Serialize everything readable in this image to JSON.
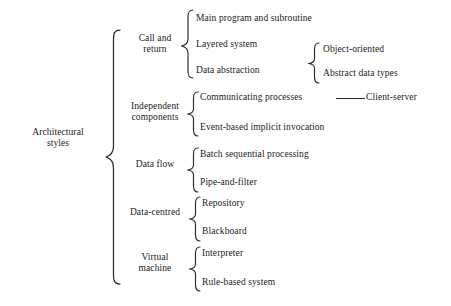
{
  "diagram": {
    "type": "tree",
    "root": {
      "label": "Architectural\nstyles"
    },
    "categories": [
      {
        "label": "Call and\nreturn",
        "children": [
          {
            "label": "Main program and subroutine"
          },
          {
            "label": "Layered system"
          },
          {
            "label": "Data abstraction",
            "children": [
              {
                "label": "Object-oriented"
              },
              {
                "label": "Abstract data types"
              }
            ]
          }
        ]
      },
      {
        "label": "Independent\ncomponents",
        "children": [
          {
            "label": "Communicating processes",
            "linked_to": "Client-server"
          },
          {
            "label": "Event-based implicit invocation"
          }
        ]
      },
      {
        "label": "Data flow",
        "children": [
          {
            "label": "Batch sequential processing"
          },
          {
            "label": "Pipe-and-filter"
          }
        ]
      },
      {
        "label": "Data-centred",
        "children": [
          {
            "label": "Repository"
          },
          {
            "label": "Blackboard"
          }
        ]
      },
      {
        "label": "Virtual\nmachine",
        "children": [
          {
            "label": "Interpreter"
          },
          {
            "label": "Rule-based system"
          }
        ]
      }
    ],
    "linked_nodes": [
      {
        "label": "Client-server"
      }
    ],
    "colors": {
      "text": "#1a1a1a",
      "stroke": "#2a2a2a",
      "background": "#ffffff"
    }
  }
}
